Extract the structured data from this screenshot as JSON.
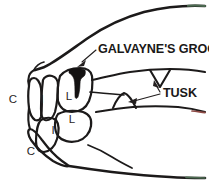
{
  "figure": {
    "background_color": "#ffffff",
    "ink_color": "#1c1a1a",
    "width": 209,
    "height": 186
  },
  "callouts": [
    {
      "id": "galvaynes-groove",
      "label": "GALVAYNE'S GROOVE",
      "text_x": 98,
      "text_y": 53,
      "anchor": "start",
      "points_to": "dark vertical groove on upper corner incisor"
    },
    {
      "id": "tusk",
      "label": "TUSK",
      "text_x": 163,
      "text_y": 97,
      "anchor": "start",
      "points_to": "upper and lower triangular canine tusks"
    }
  ],
  "tooth_labels": [
    {
      "id": "upper-canine",
      "letter": "C",
      "x": 13,
      "y": 103,
      "meaning": "canine"
    },
    {
      "id": "upper-incisor",
      "letter": "I",
      "x": 42,
      "y": 103,
      "meaning": "incisor"
    },
    {
      "id": "upper-lateral",
      "letter": "L",
      "x": 69,
      "y": 100,
      "meaning": "lateral corner tooth"
    },
    {
      "id": "lower-lateral",
      "letter": "L",
      "x": 72,
      "y": 123,
      "meaning": "lateral corner tooth"
    },
    {
      "id": "lower-incisor",
      "letter": "I",
      "x": 53,
      "y": 134,
      "meaning": "incisor"
    },
    {
      "id": "lower-canine",
      "letter": "C",
      "x": 31,
      "y": 155,
      "meaning": "canine"
    }
  ],
  "anatomy": {
    "upper_tusk": {
      "id": "upper-tusk",
      "shape": "downward-triangle",
      "cx": 160,
      "cy": 74
    },
    "lower_tusk": {
      "id": "lower-tusk",
      "shape": "upward-triangle",
      "cx": 124,
      "cy": 104
    },
    "groove": {
      "id": "galvaynes-groove-mark",
      "shape": "dark-vertical-notch",
      "cx": 77,
      "cy": 75
    }
  }
}
